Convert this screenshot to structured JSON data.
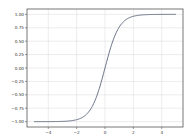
{
  "chart_data": {
    "type": "line",
    "title": "",
    "xlabel": "",
    "ylabel": "",
    "xlim": [
      -5.5,
      5.5
    ],
    "ylim": [
      -1.1,
      1.1
    ],
    "grid": true,
    "legend": null,
    "function": "tanh(x)",
    "x_range": [
      -5,
      5
    ],
    "xticks": [
      -4,
      -2,
      0,
      2,
      4
    ],
    "xtick_labels": [
      "−4",
      "−2",
      "0",
      "2",
      "4"
    ],
    "yticks": [
      -1.0,
      -0.75,
      -0.5,
      -0.25,
      0.0,
      0.25,
      0.5,
      0.75,
      1.0
    ],
    "ytick_labels": [
      "−1.00",
      "−0.75",
      "−0.50",
      "−0.25",
      "0.00",
      "0.25",
      "0.50",
      "0.75",
      "1.00"
    ],
    "series": [
      {
        "name": "tanh",
        "color": "#5a6478",
        "x": [
          -5,
          -4.5,
          -4,
          -3.5,
          -3,
          -2.5,
          -2,
          -1.75,
          -1.5,
          -1.25,
          -1,
          -0.75,
          -0.5,
          -0.25,
          0,
          0.25,
          0.5,
          0.75,
          1,
          1.25,
          1.5,
          1.75,
          2,
          2.5,
          3,
          3.5,
          4,
          4.5,
          5
        ],
        "y": [
          -0.9999,
          -0.9998,
          -0.9993,
          -0.9982,
          -0.9951,
          -0.9866,
          -0.964,
          -0.9414,
          -0.9051,
          -0.8483,
          -0.7616,
          -0.6351,
          -0.4621,
          -0.2449,
          0,
          0.2449,
          0.4621,
          0.6351,
          0.7616,
          0.8483,
          0.9051,
          0.9414,
          0.964,
          0.9866,
          0.9951,
          0.9982,
          0.9993,
          0.9998,
          0.9999
        ]
      }
    ]
  },
  "colors": {
    "frame": "#555555",
    "grid": "#d9d9d9",
    "line": "#5a6478",
    "text": "#333333"
  }
}
